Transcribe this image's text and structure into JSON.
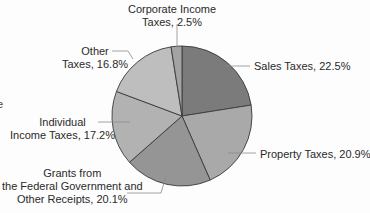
{
  "chart_data": {
    "type": "pie",
    "title": "",
    "start_angle_deg": 0,
    "direction": "clockwise",
    "slices": [
      {
        "label": "Sales Taxes",
        "value": 22.5,
        "color": "#7b7b7b"
      },
      {
        "label": "Property Taxes",
        "value": 20.9,
        "color": "#a9a9a9"
      },
      {
        "label": "Grants from the Federal Government and Other Receipts",
        "value": 20.1,
        "color": "#959595"
      },
      {
        "label": "Individual Income Taxes",
        "value": 17.2,
        "color": "#b2b2b2"
      },
      {
        "label": "Other Taxes",
        "value": 16.8,
        "color": "#bebebe"
      },
      {
        "label": "Corporate Income Taxes",
        "value": 2.5,
        "color": "#a3a3a3"
      }
    ],
    "legend": "none (leader-line labels)"
  },
  "labels": {
    "corporate": {
      "line1": "Corporate Income",
      "line2": "Taxes, 2.5%"
    },
    "other": {
      "line1": "Other",
      "line2": "Taxes, 16.8%"
    },
    "sales": {
      "line1": "Sales Taxes, 22.5%"
    },
    "individual": {
      "line1": "Individual",
      "line2": "Income Taxes, 17.2%"
    },
    "property": {
      "line1": "Property Taxes, 20.9%"
    },
    "grants": {
      "line1": "Grants from",
      "line2": "the Federal Government and",
      "line3": "Other Receipts, 20.1%"
    }
  },
  "edge_fragment": "e"
}
